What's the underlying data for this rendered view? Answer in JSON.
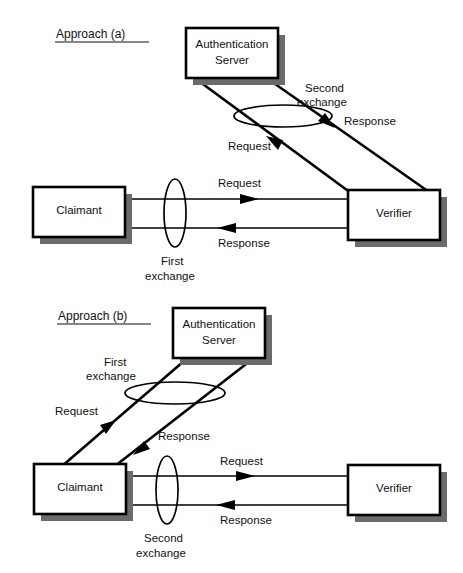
{
  "figure": {
    "colors": {
      "line": "#000000",
      "box_fill": "#ffffff",
      "box_border": "#000000",
      "shadow": "#6b6b6b",
      "text": "#111111"
    }
  },
  "approach_a": {
    "caption": "Approach (a)",
    "nodes": {
      "auth_server_line1": "Authentication",
      "auth_server_line2": "Server",
      "claimant": "Claimant",
      "verifier": "Verifier"
    },
    "exchanges": [
      {
        "name_line1": "First",
        "name_line2": "exchange",
        "between": "Claimant - Verifier",
        "order": 1,
        "messages": [
          {
            "label": "Request",
            "from": "Claimant",
            "to": "Verifier"
          },
          {
            "label": "Response",
            "from": "Verifier",
            "to": "Claimant"
          }
        ]
      },
      {
        "name_line1": "Second",
        "name_line2": "exchange",
        "between": "Verifier - Authentication Server",
        "order": 2,
        "messages": [
          {
            "label": "Request",
            "from": "Verifier",
            "to": "Authentication Server"
          },
          {
            "label": "Response",
            "from": "Authentication Server",
            "to": "Verifier"
          }
        ]
      }
    ]
  },
  "approach_b": {
    "caption": "Approach (b)",
    "nodes": {
      "auth_server_line1": "Authentication",
      "auth_server_line2": "Server",
      "claimant": "Claimant",
      "verifier": "Verifier"
    },
    "exchanges": [
      {
        "name_line1": "First",
        "name_line2": "exchange",
        "between": "Claimant - Authentication Server",
        "order": 1,
        "messages": [
          {
            "label": "Request",
            "from": "Claimant",
            "to": "Authentication Server"
          },
          {
            "label": "Response",
            "from": "Authentication Server",
            "to": "Claimant"
          }
        ]
      },
      {
        "name_line1": "Second",
        "name_line2": "exchange",
        "between": "Claimant - Verifier",
        "order": 2,
        "messages": [
          {
            "label": "Request",
            "from": "Claimant",
            "to": "Verifier"
          },
          {
            "label": "Response",
            "from": "Verifier",
            "to": "Claimant"
          }
        ]
      }
    ]
  }
}
